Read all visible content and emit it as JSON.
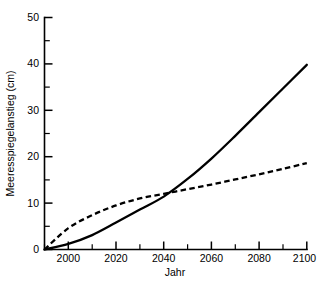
{
  "chart_data": {
    "type": "line",
    "title": "",
    "subtitle": "",
    "xlabel": "Jahr",
    "ylabel": "Meeresspiegelanstieg (cm)",
    "xlim": [
      1990,
      2100
    ],
    "ylim": [
      0,
      50
    ],
    "grid": false,
    "legend": "none",
    "xticks": [
      2000,
      2020,
      2040,
      2060,
      2080,
      2100
    ],
    "xtick_labels": [
      "2000",
      "2020",
      "2040",
      "2060",
      "2080",
      "2100"
    ],
    "xticks_minor": [
      1990,
      2010,
      2030,
      2050,
      2070,
      2090
    ],
    "yticks": [
      0,
      10,
      20,
      30,
      40,
      50
    ],
    "ytick_labels": [
      "0",
      "10",
      "20",
      "30",
      "40",
      "50"
    ],
    "yticks_minor": [
      5,
      15,
      25,
      35,
      45
    ],
    "x": [
      1990,
      2000,
      2010,
      2020,
      2030,
      2040,
      2050,
      2060,
      2070,
      2080,
      2090,
      2100
    ],
    "series": [
      {
        "name": "solid-scenario",
        "style": "solid",
        "color": "#000000",
        "values": [
          0.0,
          1.2,
          3.1,
          5.8,
          8.6,
          11.4,
          15.2,
          19.6,
          24.5,
          29.6,
          34.7,
          39.8
        ]
      },
      {
        "name": "dashed-scenario",
        "style": "dashed",
        "color": "#000000",
        "values": [
          0.0,
          4.6,
          7.4,
          9.5,
          11.0,
          12.0,
          13.0,
          14.0,
          15.1,
          16.2,
          17.4,
          18.6
        ]
      }
    ],
    "annotations": [
      {
        "name": "curve-crossing",
        "x": 2042,
        "y": 12.0
      }
    ]
  },
  "axes": {
    "y_title": "Meeresspiegelanstieg (cm)",
    "x_title": "Jahr"
  }
}
